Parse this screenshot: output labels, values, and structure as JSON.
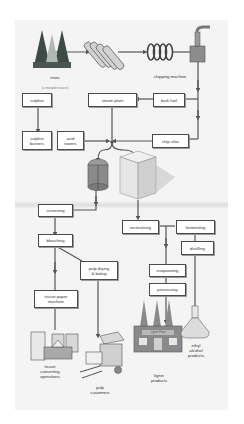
{
  "diagram": {
    "title": "",
    "nodes": {
      "trees": "trees",
      "trees_note": "(a renewable resource)",
      "chipping_machine": "chipping machine",
      "sulphur": "sulphur",
      "steam_plant": "steam plant",
      "bark_fuel": "bark fuel",
      "sulphur_burners": "sulphur\nburners",
      "acid_towers": "acid\ntowers",
      "chip_silos": "chip silos",
      "screening": "screening",
      "bleaching": "bleaching",
      "pulp_drying": "pulp drying\n& baling",
      "tissue_paper_machine": "tissue paper\nmachine",
      "neutralising": "neutralising",
      "fermenting": "fermenting",
      "distilling": "distilling",
      "evaporating": "evaporating",
      "processing": "processing",
      "tissue_converting": "tissue\nconverting\noperations",
      "pulp_customers": "pulp\ncustomers",
      "lignin_products": "lignin\nproducts",
      "lignin_plant_sign": "Lignin Plant",
      "ethyl_alcohol": "ethyl\nalcohol\nproducts"
    },
    "colors": {
      "line": "#555555",
      "box_border": "#4a4a4a",
      "background": "#f4f4f4",
      "factory": "#8a8a8a"
    }
  }
}
